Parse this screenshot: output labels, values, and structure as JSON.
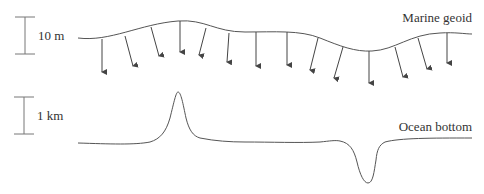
{
  "figure": {
    "geoid": {
      "label": "Marine geoid",
      "scale_label": "10 m",
      "description": "Gravity vectors point perpendicular to the geoid surface"
    },
    "ocean_bottom": {
      "label": "Ocean bottom",
      "scale_label": "1 km",
      "features": [
        "seamount",
        "trench"
      ]
    },
    "colors": {
      "line": "#555555",
      "text": "#333333",
      "scale_bar": "#777777"
    }
  }
}
